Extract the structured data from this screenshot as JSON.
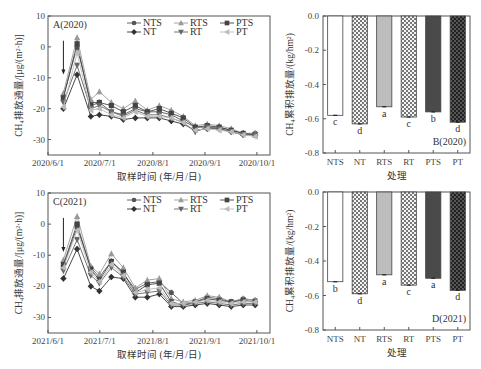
{
  "panels": {
    "A": {
      "label": "A(2020)",
      "xlabel": "取样时间 (年/月/日)",
      "ylabel": "CH₄排放通量/[μg/(m²·h)]",
      "xticks": [
        "2020/6/1",
        "2020/7/1",
        "2020/8/1",
        "2020/9/1",
        "2020/10/1"
      ],
      "yticks": [
        "10",
        "0",
        "-10",
        "-20",
        "-30"
      ]
    },
    "B": {
      "label": "B(2020)",
      "xlabel": "处理",
      "ylabel": "CH₄累积排放量/(kg/hm²)",
      "yticks": [
        "0.0",
        "-0.2",
        "-0.4",
        "-0.6",
        "-0.8"
      ]
    },
    "C": {
      "label": "C(2021)",
      "xlabel": "取样时间 (年/月/日)",
      "ylabel": "CH₄排放通量/[μg/(m²·h)]",
      "xticks": [
        "2021/6/1",
        "2021/7/1",
        "2021/8/1",
        "2021/9/1",
        "2021/10/1"
      ],
      "yticks": [
        "10",
        "0",
        "-10",
        "-20",
        "-30"
      ]
    },
    "D": {
      "label": "D(2021)",
      "xlabel": "处理",
      "ylabel": "CH₄累积排放量/(kg/hm²)",
      "yticks": [
        "0.0",
        "-0.2",
        "-0.4",
        "-0.6",
        "-0.8"
      ]
    }
  },
  "legend": [
    "NTS",
    "RTS",
    "PTS",
    "NT",
    "RT",
    "PT"
  ],
  "chart_data": [
    {
      "type": "line",
      "title": "A(2020)",
      "xlabel": "取样时间 (年/月/日)",
      "ylabel": "CH4排放通量/[μg/(m²·h)]",
      "ylim": [
        -35,
        10
      ],
      "x": [
        "2020/6/10",
        "2020/6/18",
        "2020/6/26",
        "2020/7/1",
        "2020/7/8",
        "2020/7/15",
        "2020/7/22",
        "2020/7/29",
        "2020/8/5",
        "2020/8/12",
        "2020/8/19",
        "2020/8/26",
        "2020/9/2",
        "2020/9/9",
        "2020/9/16",
        "2020/9/23",
        "2020/9/30"
      ],
      "series": [
        {
          "name": "NTS",
          "values": [
            -16,
            0,
            -18,
            -18,
            -21,
            -22,
            -20,
            -21,
            -21,
            -22,
            -24,
            -26,
            -26,
            -26,
            -27,
            -28,
            -28
          ]
        },
        {
          "name": "RTS",
          "values": [
            -15,
            3,
            -17,
            -14.5,
            -18,
            -20,
            -17.5,
            -20.5,
            -19,
            -20.5,
            -22.5,
            -25.5,
            -25,
            -25.5,
            -26.5,
            -28,
            -28
          ]
        },
        {
          "name": "PTS",
          "values": [
            -16.5,
            1,
            -19,
            -18,
            -19,
            -21,
            -19,
            -21,
            -20,
            -21.5,
            -23,
            -26,
            -25.5,
            -26,
            -27,
            -28,
            -28.5
          ]
        },
        {
          "name": "NT",
          "values": [
            -20,
            -9,
            -22.5,
            -22,
            -22.5,
            -23.5,
            -23,
            -23,
            -23,
            -24,
            -25,
            -27,
            -26.5,
            -26.5,
            -27.5,
            -28.5,
            -28.5
          ]
        },
        {
          "name": "RT",
          "values": [
            -18,
            -6,
            -20,
            -19,
            -21,
            -22.5,
            -20.5,
            -22,
            -22,
            -23,
            -24.5,
            -27.5,
            -26,
            -26.5,
            -27.5,
            -28.5,
            -28.5
          ]
        },
        {
          "name": "PT",
          "values": [
            -19.5,
            -2,
            -20.5,
            -20,
            -22,
            -23,
            -21,
            -22.5,
            -22.5,
            -23,
            -24.5,
            -27,
            -26.5,
            -27,
            -27.5,
            -28.5,
            -29
          ]
        }
      ]
    },
    {
      "type": "bar",
      "title": "B(2020)",
      "xlabel": "处理",
      "ylabel": "CH4累积排放量/(kg/hm²)",
      "ylim": [
        -0.8,
        0.0
      ],
      "categories": [
        "NTS",
        "NT",
        "RTS",
        "RT",
        "PTS",
        "PT"
      ],
      "values": [
        -0.58,
        -0.63,
        -0.53,
        -0.59,
        -0.56,
        -0.62
      ],
      "significance": [
        "c",
        "d",
        "a",
        "c",
        "b",
        "d"
      ]
    },
    {
      "type": "line",
      "title": "C(2021)",
      "xlabel": "取样时间 (年/月/日)",
      "ylabel": "CH4排放通量/[μg/(m²·h)]",
      "ylim": [
        -35,
        10
      ],
      "x": [
        "2021/6/10",
        "2021/6/18",
        "2021/6/26",
        "2021/7/1",
        "2021/7/8",
        "2021/7/15",
        "2021/7/22",
        "2021/7/29",
        "2021/8/5",
        "2021/8/12",
        "2021/8/19",
        "2021/8/26",
        "2021/9/2",
        "2021/9/9",
        "2021/9/16",
        "2021/9/23",
        "2021/9/30"
      ],
      "series": [
        {
          "name": "NTS",
          "values": [
            -13.5,
            -1,
            -14,
            -17,
            -12,
            -16,
            -21,
            -19,
            -18.5,
            -22,
            -25.5,
            -25,
            -23.5,
            -24,
            -25,
            -24,
            -24.5
          ]
        },
        {
          "name": "RTS",
          "values": [
            -11.5,
            2.5,
            -13.5,
            -16,
            -9.5,
            -14,
            -20.5,
            -18,
            -17.5,
            -24,
            -25,
            -24.5,
            -23,
            -23.5,
            -25,
            -24,
            -24.5
          ]
        },
        {
          "name": "PTS",
          "values": [
            -13,
            0,
            -14.5,
            -18,
            -12,
            -15.5,
            -22,
            -19.5,
            -19,
            -25,
            -26,
            -25,
            -24,
            -24.5,
            -25,
            -24.5,
            -25
          ]
        },
        {
          "name": "NT",
          "values": [
            -17.5,
            -8,
            -20,
            -21.5,
            -17,
            -17.5,
            -23.5,
            -23.5,
            -22.5,
            -26.5,
            -26.5,
            -26,
            -25.5,
            -26,
            -26.5,
            -26,
            -26
          ]
        },
        {
          "name": "RT",
          "values": [
            -15,
            -5,
            -16.5,
            -19,
            -14,
            -17,
            -22.5,
            -22,
            -21.5,
            -26,
            -26,
            -25.5,
            -25,
            -25.5,
            -26,
            -25.5,
            -25.5
          ]
        },
        {
          "name": "PT",
          "values": [
            -14,
            -2,
            -15.5,
            -18.5,
            -13,
            -16.5,
            -22,
            -21,
            -20.5,
            -25.5,
            -25.5,
            -25,
            -24.5,
            -25,
            -25.5,
            -25,
            -25
          ]
        }
      ]
    },
    {
      "type": "bar",
      "title": "D(2021)",
      "xlabel": "处理",
      "ylabel": "CH4累积排放量/(kg/hm²)",
      "ylim": [
        -0.8,
        0.0
      ],
      "categories": [
        "NTS",
        "NT",
        "RTS",
        "RT",
        "PTS",
        "PT"
      ],
      "values": [
        -0.52,
        -0.59,
        -0.48,
        -0.54,
        -0.5,
        -0.57
      ],
      "significance": [
        "b",
        "d",
        "a",
        "c",
        "a",
        "d"
      ]
    }
  ]
}
